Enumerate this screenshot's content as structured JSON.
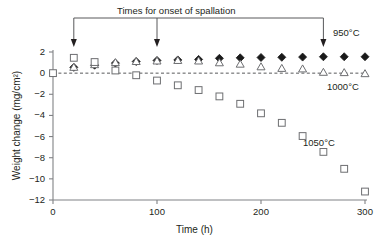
{
  "chart_data": {
    "type": "scatter",
    "title": "Times for onset of spallation",
    "xlabel": "Time (h)",
    "ylabel": "Weight change (mg/cm²)",
    "xlim": [
      0,
      300
    ],
    "ylim": [
      -12,
      2
    ],
    "xticks": [
      0,
      100,
      200,
      300
    ],
    "yticks": [
      2,
      0,
      -2,
      -4,
      -6,
      -8,
      -10,
      -12
    ],
    "xtick_labels": [
      "0",
      "100",
      "200",
      "300"
    ],
    "ytick_labels": [
      "2",
      "0",
      "−2",
      "−4",
      "−6",
      "−8",
      "−10",
      "−12"
    ],
    "grid": false,
    "legend_position": "inline-right",
    "zero_line": {
      "value": 0,
      "style": "dashed"
    },
    "series": [
      {
        "name": "950°C",
        "marker": "filled-diamond",
        "color": "#1a1a1a",
        "points": [
          {
            "x": 20,
            "y": 0.55
          },
          {
            "x": 40,
            "y": 0.75
          },
          {
            "x": 60,
            "y": 0.95
          },
          {
            "x": 80,
            "y": 1.1
          },
          {
            "x": 100,
            "y": 1.2
          },
          {
            "x": 120,
            "y": 1.25
          },
          {
            "x": 140,
            "y": 1.3
          },
          {
            "x": 160,
            "y": 1.4
          },
          {
            "x": 180,
            "y": 1.45
          },
          {
            "x": 200,
            "y": 1.48
          },
          {
            "x": 220,
            "y": 1.5
          },
          {
            "x": 240,
            "y": 1.52
          },
          {
            "x": 260,
            "y": 1.55
          },
          {
            "x": 280,
            "y": 1.55
          },
          {
            "x": 300,
            "y": 1.55
          }
        ]
      },
      {
        "name": "1000°C",
        "marker": "open-triangle",
        "color": "#6d6e71",
        "points": [
          {
            "x": 20,
            "y": 0.55
          },
          {
            "x": 40,
            "y": 0.8
          },
          {
            "x": 60,
            "y": 1.0
          },
          {
            "x": 80,
            "y": 1.1
          },
          {
            "x": 100,
            "y": 1.15
          },
          {
            "x": 120,
            "y": 1.2
          },
          {
            "x": 140,
            "y": 1.15
          },
          {
            "x": 160,
            "y": 0.98
          },
          {
            "x": 180,
            "y": 0.85
          },
          {
            "x": 200,
            "y": 0.6
          },
          {
            "x": 220,
            "y": 0.45
          },
          {
            "x": 240,
            "y": 0.4
          },
          {
            "x": 260,
            "y": 0.08
          },
          {
            "x": 280,
            "y": 0.05
          },
          {
            "x": 300,
            "y": -0.05
          }
        ]
      },
      {
        "name": "1050°C",
        "marker": "open-square",
        "color": "#6d6e71",
        "points": [
          {
            "x": 0,
            "y": 0.0
          },
          {
            "x": 20,
            "y": 1.45
          },
          {
            "x": 40,
            "y": 1.05
          },
          {
            "x": 60,
            "y": 0.25
          },
          {
            "x": 80,
            "y": -0.2
          },
          {
            "x": 100,
            "y": -0.7
          },
          {
            "x": 120,
            "y": -1.15
          },
          {
            "x": 140,
            "y": -1.6
          },
          {
            "x": 160,
            "y": -2.2
          },
          {
            "x": 180,
            "y": -2.9
          },
          {
            "x": 200,
            "y": -3.8
          },
          {
            "x": 220,
            "y": -4.7
          },
          {
            "x": 240,
            "y": -5.95
          },
          {
            "x": 260,
            "y": -7.45
          },
          {
            "x": 280,
            "y": -9.05
          },
          {
            "x": 300,
            "y": -11.2
          }
        ]
      }
    ],
    "annotations": [
      {
        "label": "Times for onset of spallation",
        "type": "bracket-with-arrows",
        "arrow_x_values": [
          20,
          100,
          260
        ]
      }
    ]
  }
}
